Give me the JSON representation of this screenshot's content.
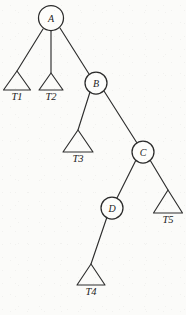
{
  "figure": {
    "type": "tree-diagram",
    "background_color": "#fbfbf9",
    "stroke_color": "#2e2e2e",
    "width": 186,
    "height": 315,
    "nodes": [
      {
        "id": "A",
        "label": "A",
        "cx": 51,
        "cy": 18,
        "r": 12.5
      },
      {
        "id": "B",
        "label": "B",
        "cx": 96,
        "cy": 83,
        "r": 11.0
      },
      {
        "id": "C",
        "label": "C",
        "cx": 143,
        "cy": 152,
        "r": 11.0
      },
      {
        "id": "D",
        "label": "D",
        "cx": 112,
        "cy": 208,
        "r": 11.0
      }
    ],
    "subtrees": [
      {
        "id": "T1",
        "label": "T1",
        "apex_x": 17,
        "apex_y": 71,
        "base_y": 90,
        "half_width": 13.5,
        "label_y": 100
      },
      {
        "id": "T2",
        "label": "T2",
        "apex_x": 51,
        "apex_y": 73,
        "base_y": 90,
        "half_width": 12.0,
        "label_y": 100
      },
      {
        "id": "T3",
        "label": "T3",
        "apex_x": 78,
        "apex_y": 130,
        "base_y": 152,
        "half_width": 15.0,
        "label_y": 162
      },
      {
        "id": "T4",
        "label": "T4",
        "apex_x": 91,
        "apex_y": 264,
        "base_y": 285,
        "half_width": 14.0,
        "label_y": 295
      },
      {
        "id": "T5",
        "label": "T5",
        "apex_x": 168,
        "apex_y": 190,
        "base_y": 213,
        "half_width": 14.5,
        "label_y": 223
      }
    ],
    "edges": [
      {
        "from": "A",
        "to": "T1",
        "x1": 43,
        "y1": 29,
        "x2": 17,
        "y2": 71
      },
      {
        "from": "A",
        "to": "T2",
        "x1": 51,
        "y1": 31,
        "x2": 51,
        "y2": 73
      },
      {
        "from": "A",
        "to": "B",
        "x1": 60,
        "y1": 28,
        "x2": 89,
        "y2": 74
      },
      {
        "from": "B",
        "to": "T3",
        "x1": 90,
        "y1": 92,
        "x2": 78,
        "y2": 130
      },
      {
        "from": "B",
        "to": "C",
        "x1": 104,
        "y1": 91,
        "x2": 137,
        "y2": 143
      },
      {
        "from": "C",
        "to": "D",
        "x1": 136,
        "y1": 160,
        "x2": 117,
        "y2": 198
      },
      {
        "from": "C",
        "to": "T5",
        "x1": 150,
        "y1": 160,
        "x2": 168,
        "y2": 190
      },
      {
        "from": "D",
        "to": "T4",
        "x1": 107,
        "y1": 217,
        "x2": 91,
        "y2": 264
      }
    ]
  }
}
